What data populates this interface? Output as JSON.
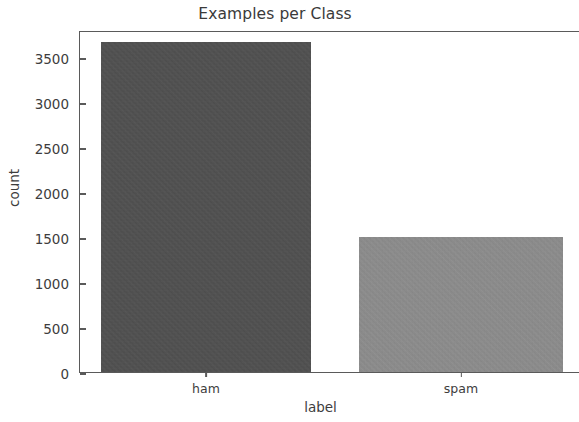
{
  "chart_data": {
    "type": "bar",
    "title": "Examples per Class",
    "xlabel": "label",
    "ylabel": "count",
    "categories": [
      "ham",
      "spam"
    ],
    "values": [
      3672,
      1500
    ],
    "series": [
      {
        "name": "count",
        "values": [
          3672,
          1500
        ]
      }
    ],
    "yticks": [
      0,
      500,
      1000,
      1500,
      2000,
      2500,
      3000,
      3500
    ],
    "ytick_labels": [
      "0",
      "500",
      "1000",
      "1500",
      "2000",
      "2500",
      "3000",
      "3500"
    ],
    "ylim": [
      0,
      3800
    ],
    "grid": false,
    "legend": false,
    "legend_position": "none",
    "bar_colors": [
      "#4d4d4d",
      "#8e8e8e"
    ],
    "spines": {
      "left": true,
      "top": true,
      "bottom": true,
      "right": false
    },
    "axis_color": "#5a5a5a",
    "text_color": "#3d3d3d",
    "background": "#ffffff"
  }
}
